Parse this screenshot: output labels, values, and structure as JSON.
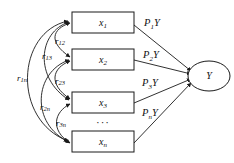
{
  "diagram": {
    "type": "path-diagram",
    "colors": {
      "stroke": "#1a1a1a",
      "background": "#ffffff",
      "text": "#111111"
    },
    "predictor_nodes": [
      {
        "id": "x1",
        "base": "x",
        "sub": "1",
        "shape": "rectangle"
      },
      {
        "id": "x2",
        "base": "x",
        "sub": "2",
        "shape": "rectangle"
      },
      {
        "id": "x3",
        "base": "x",
        "sub": "3",
        "shape": "rectangle"
      },
      {
        "id": "xn",
        "base": "x",
        "sub": "n",
        "shape": "rectangle"
      }
    ],
    "ellipsis": "···",
    "outcome_node": {
      "id": "Y",
      "base": "Y",
      "shape": "ellipse"
    },
    "path_edges": [
      {
        "id": "p1",
        "from": "x1",
        "to": "Y",
        "base": "P",
        "sub": "1",
        "tail": "Y"
      },
      {
        "id": "p2",
        "from": "x2",
        "to": "Y",
        "base": "P",
        "sub": "2",
        "tail": "Y"
      },
      {
        "id": "p3",
        "from": "x3",
        "to": "Y",
        "base": "P",
        "sub": "3",
        "tail": "Y"
      },
      {
        "id": "pn",
        "from": "xn",
        "to": "Y",
        "base": "P",
        "sub": "n",
        "tail": "Y"
      }
    ],
    "correlation_edges": [
      {
        "id": "r12",
        "from": "x1",
        "to": "x2",
        "base": "r",
        "sub": "12"
      },
      {
        "id": "r13",
        "from": "x1",
        "to": "x3",
        "base": "r",
        "sub": "13"
      },
      {
        "id": "r1n",
        "from": "x1",
        "to": "xn",
        "base": "r",
        "sub": "1n"
      },
      {
        "id": "r23",
        "from": "x2",
        "to": "x3",
        "base": "r",
        "sub": "23"
      },
      {
        "id": "r2n",
        "from": "x2",
        "to": "xn",
        "base": "r",
        "sub": "2n"
      },
      {
        "id": "r3n",
        "from": "x3",
        "to": "xn",
        "base": "r",
        "sub": "3n"
      }
    ]
  }
}
